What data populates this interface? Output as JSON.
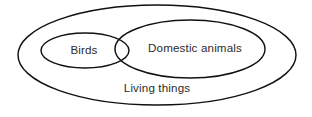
{
  "diagram": {
    "type": "venn",
    "title": "",
    "background_color": "#ffffff",
    "stroke_color": "#111111",
    "text_color": "#2b2b2b",
    "sets": [
      {
        "id": "living-things",
        "label": "Living things",
        "role": "universal-outer-set",
        "shape": "ellipse",
        "cx": 157,
        "cy": 55,
        "rx": 139,
        "ry": 50,
        "label_x": 157,
        "label_y": 88.5
      },
      {
        "id": "birds",
        "label": "Birds",
        "role": "inner-set",
        "shape": "ellipse",
        "cx": 85,
        "cy": 50.5,
        "rx": 44,
        "ry": 17.5,
        "label_x": 84,
        "label_y": 50.5
      },
      {
        "id": "domestic-animals",
        "label": "Domestic animals",
        "role": "inner-set",
        "shape": "ellipse",
        "cx": 190,
        "cy": 49,
        "rx": 75,
        "ry": 29,
        "label_x": 195,
        "label_y": 49
      }
    ],
    "relations": [
      "Birds is a subset of Living things",
      "Domestic animals is a subset of Living things",
      "Birds overlaps Domestic animals"
    ]
  }
}
